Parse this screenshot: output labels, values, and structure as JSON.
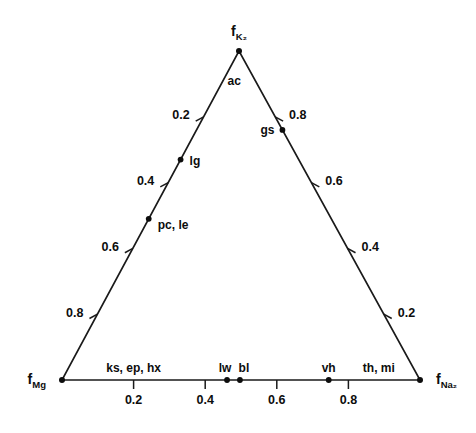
{
  "chart_data": {
    "type": "scatter",
    "plot_kind": "ternary-diagram",
    "title": "",
    "subtitle": "",
    "xlabel": "",
    "ylabel": "",
    "grid": false,
    "legend": "none",
    "axis_range": [
      0,
      1
    ],
    "vertices": [
      {
        "id": "top",
        "base": "f",
        "sub": "K₂",
        "label": "fK2",
        "x": 239,
        "y": 51
      },
      {
        "id": "left",
        "base": "f",
        "sub": "Mg",
        "label": "fMg",
        "x": 62,
        "y": 380
      },
      {
        "id": "right",
        "base": "f",
        "sub": "Na₂",
        "label": "fNa2",
        "x": 420,
        "y": 380
      }
    ],
    "axes": [
      {
        "name": "left-edge",
        "from": "left",
        "to": "top",
        "tick_labels": [
          "0.2",
          "0.4",
          "0.6",
          "0.8"
        ],
        "tick_fractions_from_top": [
          0.2,
          0.4,
          0.6,
          0.8
        ],
        "label_side": "outside-left"
      },
      {
        "name": "right-edge",
        "from": "top",
        "to": "right",
        "tick_labels": [
          "0.8",
          "0.6",
          "0.4",
          "0.2"
        ],
        "tick_fractions_from_top": [
          0.2,
          0.4,
          0.6,
          0.8
        ],
        "label_side": "outside-right"
      },
      {
        "name": "bottom-edge",
        "from": "left",
        "to": "right",
        "tick_labels": [
          "0.2",
          "0.4",
          "0.6",
          "0.8"
        ],
        "tick_fractions_from_left": [
          0.2,
          0.4,
          0.6,
          0.8
        ],
        "label_side": "below"
      }
    ],
    "points": [
      {
        "label": "ac",
        "edge": "right-edge",
        "t": 0.055,
        "anchor": "end",
        "dx": -8,
        "dy": 16,
        "dot": false
      },
      {
        "label": "gs",
        "edge": "right-edge",
        "t": 0.24,
        "anchor": "end",
        "dx": -8,
        "dy": 4,
        "dot": true
      },
      {
        "label": "pc, le",
        "edge": "left-edge",
        "t": 0.49,
        "anchor": "start",
        "dx": 9,
        "dy": 10,
        "dot": true
      },
      {
        "label": "lg",
        "edge": "left-edge",
        "t": 0.67,
        "anchor": "start",
        "dx": 9,
        "dy": 5,
        "dot": true
      },
      {
        "label": "ks, ep, hx",
        "edge": "bottom-edge",
        "t": 0.2,
        "anchor": "middle",
        "dx": 0,
        "dy": -8,
        "dot": false
      },
      {
        "label": "lw",
        "edge": "bottom-edge",
        "t": 0.461,
        "anchor": "middle",
        "dx": -2,
        "dy": -8,
        "dot": true
      },
      {
        "label": "bl",
        "edge": "bottom-edge",
        "t": 0.497,
        "anchor": "middle",
        "dx": 4,
        "dy": -8,
        "dot": true
      },
      {
        "label": "vh",
        "edge": "bottom-edge",
        "t": 0.745,
        "anchor": "middle",
        "dx": 0,
        "dy": -8,
        "dot": true
      },
      {
        "label": "th, mi",
        "edge": "bottom-edge",
        "t": 0.885,
        "anchor": "middle",
        "dx": 0,
        "dy": -8,
        "dot": false
      }
    ],
    "colors": {
      "line": "#1a1a1a",
      "text": "#0d0d0d",
      "background": "#ffffff",
      "dot": "#0d0d0d"
    }
  }
}
